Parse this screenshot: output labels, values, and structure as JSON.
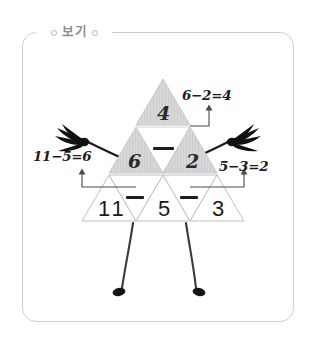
{
  "legend": {
    "label": "보기",
    "left_dot": "circle-dot",
    "right_dot": "circle-dot"
  },
  "colors": {
    "border": "#cfcdd2",
    "legend_text": "#8c8a90",
    "triangle_fill_gray": "#d6d6d6",
    "triangle_stroke": "#b5b5b5",
    "ink": "#1d1d1d"
  },
  "figure": {
    "rows": [
      {
        "row": 1,
        "cells": [
          {
            "text": "4",
            "fill": "gray",
            "orientation": "up"
          }
        ]
      },
      {
        "row": 2,
        "cells": [
          {
            "text": "6",
            "fill": "gray",
            "orientation": "up"
          },
          {
            "text": "−",
            "fill": "white",
            "orientation": "down"
          },
          {
            "text": "2",
            "fill": "gray",
            "orientation": "up"
          }
        ]
      },
      {
        "row": 3,
        "cells": [
          {
            "text": "11",
            "fill": "white",
            "orientation": "up"
          },
          {
            "text": "−",
            "fill": "white",
            "orientation": "down"
          },
          {
            "text": "5",
            "fill": "white",
            "orientation": "up"
          },
          {
            "text": "−",
            "fill": "white",
            "orientation": "down"
          },
          {
            "text": "3",
            "fill": "white",
            "orientation": "up"
          }
        ]
      }
    ],
    "annotations": [
      {
        "id": "top-right",
        "text": "6−2=4"
      },
      {
        "id": "left",
        "text": "11−5=6"
      },
      {
        "id": "right",
        "text": "5−3=2"
      }
    ],
    "limbs": {
      "left_arm": "hand-brush-stroke",
      "right_arm": "hand-brush-stroke",
      "left_leg": "leg-with-foot",
      "right_leg": "leg-with-foot"
    }
  }
}
